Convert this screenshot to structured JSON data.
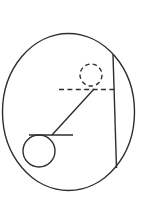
{
  "figure": {
    "background": "#ffffff",
    "stroke_color": "#2e2e2e",
    "stroke_width": 1.4,
    "width": 146,
    "height": 212,
    "shapes": [
      {
        "name": "outer-ellipse",
        "tag": "ellipse",
        "cx": 68.5,
        "cy": 112,
        "rx": 66,
        "ry": 78.5
      },
      {
        "name": "vertical-chord-line",
        "tag": "line",
        "x1": 113,
        "y1": 54.5,
        "x2": 116.5,
        "y2": 168
      },
      {
        "name": "height-reference-dashed-line",
        "tag": "line",
        "x1": 59,
        "y1": 89.5,
        "x2": 116.5,
        "y2": 89.5,
        "stroke-dasharray": "5 3.4"
      },
      {
        "name": "raised-bob-dashed-circle",
        "tag": "circle",
        "cx": 91,
        "cy": 75,
        "r": 11,
        "stroke-dasharray": "4.4 3.2"
      },
      {
        "name": "pendulum-string-line",
        "tag": "line",
        "x1": 94,
        "y1": 89,
        "x2": 52,
        "y2": 135
      },
      {
        "name": "pivot-bar-line",
        "tag": "line",
        "x1": 29,
        "y1": 135,
        "x2": 73,
        "y2": 135
      },
      {
        "name": "rest-bob-circle",
        "tag": "circle",
        "cx": 39,
        "cy": 151,
        "r": 16
      }
    ]
  }
}
